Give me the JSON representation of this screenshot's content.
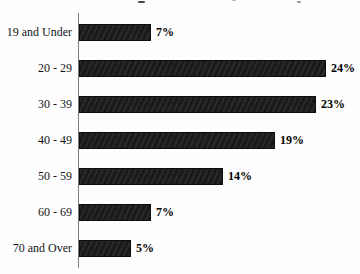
{
  "chart_data": {
    "type": "bar",
    "orientation": "horizontal",
    "title": "",
    "title_note": "title cropped out of frame; only descender specks visible at top edge",
    "categories": [
      "19 and Under",
      "20 - 29",
      "30 - 39",
      "40 - 49",
      "50 - 59",
      "60 - 69",
      "70 and Over"
    ],
    "values": [
      7,
      24,
      23,
      19,
      14,
      7,
      5
    ],
    "value_labels": [
      "7%",
      "24%",
      "23%",
      "19%",
      "14%",
      "7%",
      "5%"
    ],
    "xlabel": "",
    "ylabel": "",
    "xlim": [
      0,
      25
    ],
    "grid": false,
    "legend": false,
    "value_labels_position": "outside-end"
  },
  "colors": {
    "bar_fill": "#1e1e1e",
    "bar_border": "#0d0d0d",
    "axis_line": "#7d7d7d",
    "label_text": "#141414",
    "background": "#fefefe"
  },
  "geometry": {
    "px_per_percent": 10.3
  }
}
